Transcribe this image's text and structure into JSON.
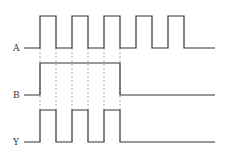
{
  "diagram": {
    "type": "timing-diagram",
    "signals": [
      {
        "name": "A",
        "label": "A",
        "high_y": 16,
        "low_y": 48,
        "start_x": 24,
        "end_x": 215,
        "pulses": [
          [
            40,
            56
          ],
          [
            72,
            88
          ],
          [
            104,
            120
          ],
          [
            136,
            152
          ],
          [
            168,
            184
          ]
        ]
      },
      {
        "name": "B",
        "label": "B",
        "high_y": 63,
        "low_y": 95,
        "start_x": 24,
        "end_x": 215,
        "pulses": [
          [
            40,
            120
          ]
        ]
      },
      {
        "name": "Y",
        "label": "Y",
        "high_y": 110,
        "low_y": 142,
        "start_x": 24,
        "end_x": 215,
        "pulses": [
          [
            40,
            56
          ],
          [
            72,
            88
          ],
          [
            104,
            120
          ]
        ]
      }
    ],
    "guides": {
      "x": [
        40,
        56,
        72,
        88,
        104,
        120
      ],
      "y_from": 48,
      "y_to": 110
    },
    "relation": "Y = A AND B",
    "colors": {
      "signal": "#333333",
      "guide": "#777777",
      "background": "#ffffff"
    }
  }
}
